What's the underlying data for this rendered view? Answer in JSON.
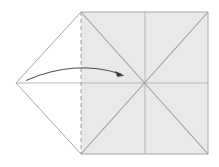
{
  "figure": {
    "type": "origami-fold-diagram",
    "title": "",
    "caption": "",
    "canvas": {
      "width": 219,
      "height": 167,
      "background": "#ffffff"
    }
  },
  "colors": {
    "paper_shaded": "#e9e9e7",
    "paper_unshaded": "#ffffff",
    "outline": "#a8a8a8",
    "crease_line": "#9a9a9a",
    "diagonal_line": "#9c9c9c",
    "fold_dashed": "#9c9c9c",
    "arrow": "#4a4a4a"
  },
  "geometry": {
    "square": {
      "label": "shaded-square-panel",
      "left": 81,
      "right": 208,
      "top": 12,
      "bottom": 154,
      "points": "81,12 208,12 208,154 81,154"
    },
    "left_triangle": {
      "label": "left-point-flap",
      "apex": [
        16,
        83
      ],
      "top": [
        81,
        12
      ],
      "bottom": [
        81,
        154
      ],
      "points": "81,12 16,83 81,154"
    },
    "lines": {
      "horizontal_center": {
        "x1": 16,
        "y1": 83,
        "x2": 208,
        "y2": 83
      },
      "vertical_mid": {
        "x1": 145,
        "y1": 12,
        "x2": 145,
        "y2": 154
      },
      "diagonal_tl_br": {
        "x1": 81,
        "y1": 12,
        "x2": 208,
        "y2": 154
      },
      "diagonal_bl_tr": {
        "x1": 81,
        "y1": 154,
        "x2": 208,
        "y2": 12
      },
      "triangle_upper_edge": {
        "x1": 81,
        "y1": 12,
        "x2": 16,
        "y2": 83
      },
      "triangle_lower_edge": {
        "x1": 16,
        "y1": 83,
        "x2": 81,
        "y2": 154
      },
      "fold_dashed_vertical": {
        "x1": 81,
        "y1": 12,
        "x2": 81,
        "y2": 154,
        "dash": "4 3"
      }
    },
    "arrow": {
      "label": "fold-direction-arrow",
      "path": "M 26,80.5 Q 75,60 122,74",
      "head": [
        122,
        74.5
      ],
      "head_angle_deg": 18
    }
  },
  "annotations": {
    "fold_dashed_meaning": "valley fold line",
    "arrow_meaning": "fold left point to the right"
  }
}
